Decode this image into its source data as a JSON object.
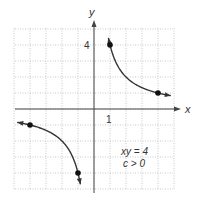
{
  "chart_data": {
    "type": "line",
    "title": "",
    "equation": "xy = 4",
    "condition": "c > 0",
    "xlabel": "x",
    "ylabel": "y",
    "x_tick_label": "1",
    "y_tick_label": "4",
    "xlim": [
      -5,
      5
    ],
    "ylim": [
      -5,
      5
    ],
    "grid": true,
    "series": [
      {
        "name": "branch-q1",
        "points": [
          [
            1,
            4
          ],
          [
            4,
            1
          ]
        ],
        "function": "y = 4/x",
        "x_range": [
          0.9,
          4.8
        ]
      },
      {
        "name": "branch-q3",
        "points": [
          [
            -4,
            -1
          ],
          [
            -1,
            -4
          ]
        ],
        "function": "y = 4/x",
        "x_range": [
          -4.8,
          -0.85
        ]
      }
    ],
    "colors": {
      "curve": "#333333",
      "grid": "#bbbbbb",
      "axis": "#444444"
    }
  },
  "labels": {
    "x_axis": "x",
    "y_axis": "y",
    "tick_x1": "1",
    "tick_y4": "4",
    "equation": "xy = 4",
    "condition": "c > 0"
  }
}
